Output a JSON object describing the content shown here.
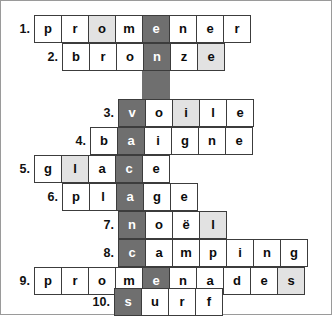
{
  "puzzle": {
    "title": "",
    "hidden_word_column_index": 4,
    "colors": {
      "key_column": "#6f6f6f",
      "highlight": "#e2e2e2",
      "cell_border": "#3c3c3c",
      "frame_border": "#9a9a9a",
      "background": "#ffffff",
      "text": "#0b0b0b",
      "key_text": "#ffffff"
    },
    "cell_size_px": 28,
    "rows": [
      {
        "number": "1.",
        "answer": "promener",
        "start_col": 0,
        "num_left": 3,
        "row_top": 14,
        "cells": [
          {
            "letter": "p",
            "style": "plain"
          },
          {
            "letter": "r",
            "style": "plain"
          },
          {
            "letter": "o",
            "style": "hl"
          },
          {
            "letter": "m",
            "style": "plain"
          },
          {
            "letter": "e",
            "style": "key"
          },
          {
            "letter": "n",
            "style": "plain"
          },
          {
            "letter": "e",
            "style": "plain"
          },
          {
            "letter": "r",
            "style": "plain"
          }
        ]
      },
      {
        "number": "2.",
        "answer": "bronze",
        "start_col": 1,
        "num_left": 31,
        "row_top": 42,
        "cells": [
          {
            "letter": "b",
            "style": "plain"
          },
          {
            "letter": "r",
            "style": "plain"
          },
          {
            "letter": "o",
            "style": "plain"
          },
          {
            "letter": "n",
            "style": "key"
          },
          {
            "letter": "z",
            "style": "plain"
          },
          {
            "letter": "e",
            "style": "hl"
          }
        ]
      },
      {
        "number": "",
        "answer": "",
        "start_col": 4,
        "num_left": 0,
        "row_top": 70,
        "cells": [
          {
            "letter": "",
            "style": "blank"
          }
        ]
      },
      {
        "number": "3.",
        "answer": "voile",
        "start_col": 4,
        "num_left": 87,
        "row_top": 98,
        "cells": [
          {
            "letter": "v",
            "style": "key"
          },
          {
            "letter": "o",
            "style": "plain"
          },
          {
            "letter": "i",
            "style": "hl"
          },
          {
            "letter": "l",
            "style": "plain"
          },
          {
            "letter": "e",
            "style": "plain"
          }
        ]
      },
      {
        "number": "4.",
        "answer": "baigne",
        "start_col": 3,
        "num_left": 59,
        "row_top": 126,
        "cells": [
          {
            "letter": "b",
            "style": "plain"
          },
          {
            "letter": "a",
            "style": "key"
          },
          {
            "letter": "i",
            "style": "plain"
          },
          {
            "letter": "g",
            "style": "plain"
          },
          {
            "letter": "n",
            "style": "plain"
          },
          {
            "letter": "e",
            "style": "plain"
          }
        ]
      },
      {
        "number": "5.",
        "answer": "glace",
        "start_col": 1,
        "num_left": 3,
        "row_top": 154,
        "cells": [
          {
            "letter": "g",
            "style": "plain"
          },
          {
            "letter": "l",
            "style": "hl"
          },
          {
            "letter": "a",
            "style": "plain"
          },
          {
            "letter": "c",
            "style": "key"
          },
          {
            "letter": "e",
            "style": "plain"
          }
        ]
      },
      {
        "number": "6.",
        "answer": "plage",
        "start_col": 2,
        "num_left": 31,
        "row_top": 182,
        "cells": [
          {
            "letter": "p",
            "style": "plain"
          },
          {
            "letter": "l",
            "style": "plain"
          },
          {
            "letter": "a",
            "style": "key"
          },
          {
            "letter": "g",
            "style": "plain"
          },
          {
            "letter": "e",
            "style": "plain"
          }
        ]
      },
      {
        "number": "7.",
        "answer": "noël",
        "start_col": 4,
        "num_left": 87,
        "row_top": 210,
        "cells": [
          {
            "letter": "n",
            "style": "key"
          },
          {
            "letter": "o",
            "style": "plain"
          },
          {
            "letter": "ë",
            "style": "plain"
          },
          {
            "letter": "l",
            "style": "hl"
          }
        ]
      },
      {
        "number": "8.",
        "answer": "camping",
        "start_col": 4,
        "num_left": 87,
        "row_top": 238,
        "cells": [
          {
            "letter": "c",
            "style": "key"
          },
          {
            "letter": "a",
            "style": "plain"
          },
          {
            "letter": "m",
            "style": "plain"
          },
          {
            "letter": "p",
            "style": "plain"
          },
          {
            "letter": "i",
            "style": "plain"
          },
          {
            "letter": "n",
            "style": "plain"
          },
          {
            "letter": "g",
            "style": "plain"
          }
        ]
      },
      {
        "number": "9.",
        "answer": "promenades",
        "start_col": 0,
        "num_left": 3,
        "row_top": 266,
        "cells": [
          {
            "letter": "p",
            "style": "plain"
          },
          {
            "letter": "r",
            "style": "plain"
          },
          {
            "letter": "o",
            "style": "plain"
          },
          {
            "letter": "m",
            "style": "plain"
          },
          {
            "letter": "e",
            "style": "key"
          },
          {
            "letter": "n",
            "style": "plain"
          },
          {
            "letter": "a",
            "style": "plain"
          },
          {
            "letter": "d",
            "style": "plain"
          },
          {
            "letter": "e",
            "style": "plain"
          },
          {
            "letter": "s",
            "style": "hl"
          }
        ]
      },
      {
        "number": "10.",
        "answer": "surf",
        "start_col": 4,
        "num_left": 83,
        "row_top": 287,
        "cells": [
          {
            "letter": "s",
            "style": "key"
          },
          {
            "letter": "u",
            "style": "plain"
          },
          {
            "letter": "r",
            "style": "plain"
          },
          {
            "letter": "f",
            "style": "plain"
          }
        ]
      }
    ]
  }
}
